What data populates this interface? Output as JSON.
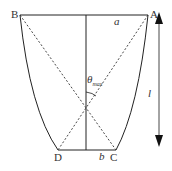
{
  "diagram": {
    "points": {
      "A": {
        "label": "A",
        "x": 148,
        "y": 15
      },
      "B": {
        "label": "B",
        "x": 20,
        "y": 15
      },
      "C": {
        "label": "C",
        "x": 116,
        "y": 150
      },
      "D": {
        "label": "D",
        "x": 58,
        "y": 150
      }
    },
    "labels": {
      "a": "a",
      "b": "b",
      "l": "l",
      "theta": "θ",
      "theta_sub": "max"
    },
    "colors": {
      "stroke": "#222222",
      "text": "#333333"
    }
  }
}
